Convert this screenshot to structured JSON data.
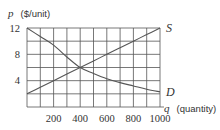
{
  "chart_data": {
    "type": "line",
    "title": "",
    "xlabel": "q (quantity)",
    "ylabel": "p ($/unit)",
    "x_var": "q",
    "x_unit": "(quantity)",
    "y_var": "p",
    "y_unit": "($/unit)",
    "xlim": [
      0,
      1000
    ],
    "ylim": [
      0,
      12
    ],
    "grid": true,
    "x_grid_step": 100,
    "y_grid_step": 2,
    "x_ticks": [
      "200",
      "400",
      "600",
      "800",
      "1000"
    ],
    "x_tick_values": [
      200,
      400,
      600,
      800,
      1000
    ],
    "y_ticks": [
      "4",
      "8",
      "12"
    ],
    "y_tick_values": [
      4,
      8,
      12
    ],
    "x": [
      0,
      100,
      200,
      300,
      400,
      500,
      600,
      700,
      800,
      900,
      1000
    ],
    "series": [
      {
        "name": "S",
        "label": "S",
        "description": "Supply",
        "values": [
          2,
          3,
          4,
          5,
          6,
          7,
          8,
          9,
          10,
          11,
          12
        ]
      },
      {
        "name": "D",
        "label": "D",
        "description": "Demand",
        "values": [
          12,
          10.7,
          9.4,
          7.6,
          6,
          5.1,
          4.3,
          3.7,
          3.2,
          2.7,
          2.3
        ]
      }
    ],
    "annotations": [
      {
        "text": "S",
        "at": [
          1000,
          12
        ]
      },
      {
        "text": "D",
        "at": [
          1000,
          2.3
        ]
      }
    ],
    "intersection": {
      "q": 400,
      "p": 6
    },
    "colors": {
      "grid": "#555555",
      "curve": "#555555",
      "text": "#333333"
    }
  }
}
